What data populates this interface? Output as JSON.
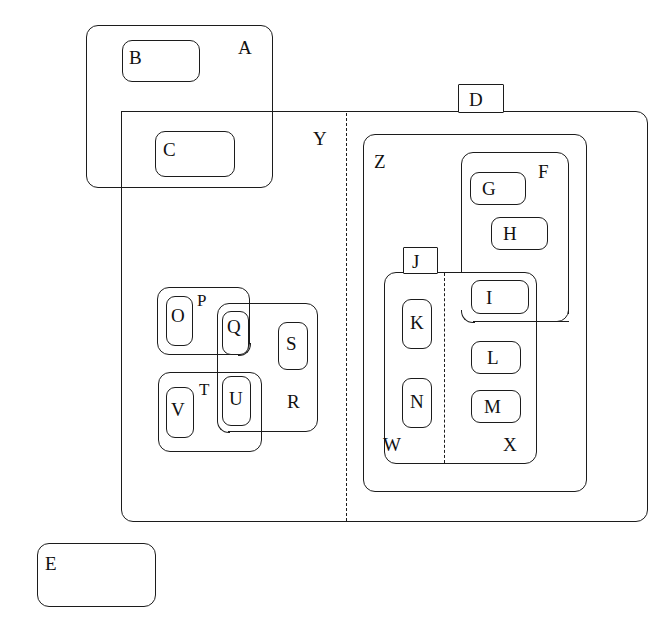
{
  "figure": {
    "type": "nested-region-diagram",
    "background": "#ffffff",
    "stroke_color": "#1c1c1c",
    "text_color": "#111111",
    "width": 665,
    "height": 644,
    "caption": ""
  },
  "regions": [
    {
      "id": "A",
      "label": "A",
      "shape": "rounded-rect",
      "x": 86,
      "y": 25,
      "w": 187,
      "h": 163,
      "label_x": 238,
      "label_y": 38,
      "style": "solid"
    },
    {
      "id": "B",
      "label": "B",
      "shape": "rounded-rect",
      "x": 122,
      "y": 40,
      "w": 78,
      "h": 42,
      "label_x": 129,
      "label_y": 48,
      "style": "solid"
    },
    {
      "id": "C",
      "label": "C",
      "shape": "rounded-rect",
      "x": 155,
      "y": 131,
      "w": 80,
      "h": 46,
      "label_x": 163,
      "label_y": 140,
      "style": "solid"
    },
    {
      "id": "Y",
      "label": "Y",
      "shape": "rounded-rect",
      "x": 121,
      "y": 111,
      "w": 527,
      "h": 411,
      "label_x": 313,
      "label_y": 129,
      "style": "solid"
    },
    {
      "id": "D",
      "label": "D",
      "shape": "tab-rect",
      "x": 458,
      "y": 84,
      "w": 46,
      "h": 28,
      "label_x": 469,
      "label_y": 90,
      "style": "solid"
    },
    {
      "id": "Z",
      "label": "Z",
      "shape": "rounded-rect",
      "x": 363,
      "y": 134,
      "w": 224,
      "h": 358,
      "label_x": 374,
      "label_y": 152,
      "style": "solid"
    },
    {
      "id": "F",
      "label": "F",
      "shape": "rounded-rect",
      "x": 461,
      "y": 152,
      "w": 108,
      "h": 170,
      "label_x": 538,
      "label_y": 162,
      "style": "solid"
    },
    {
      "id": "G",
      "label": "G",
      "shape": "rounded-rect",
      "x": 470,
      "y": 172,
      "w": 56,
      "h": 33,
      "label_x": 482,
      "label_y": 179,
      "style": "solid"
    },
    {
      "id": "H",
      "label": "H",
      "shape": "rounded-rect",
      "x": 491,
      "y": 217,
      "w": 57,
      "h": 33,
      "label_x": 503,
      "label_y": 224,
      "style": "solid"
    },
    {
      "id": "I",
      "label": "I",
      "shape": "rounded-rect",
      "x": 471,
      "y": 280,
      "w": 58,
      "h": 34,
      "label_x": 486,
      "label_y": 288,
      "style": "solid"
    },
    {
      "id": "J",
      "label": "J",
      "shape": "tab-rect",
      "x": 403,
      "y": 247,
      "w": 35,
      "h": 27,
      "label_x": 412,
      "label_y": 252,
      "style": "solid"
    },
    {
      "id": "JW",
      "label": "",
      "shape": "rounded-rect",
      "x": 384,
      "y": 272,
      "w": 153,
      "h": 192,
      "label_x": 0,
      "label_y": 0,
      "style": "solid"
    },
    {
      "id": "W",
      "label": "W",
      "shape": "label-only",
      "x": 0,
      "y": 0,
      "w": 0,
      "h": 0,
      "label_x": 383,
      "label_y": 435,
      "style": "none"
    },
    {
      "id": "X",
      "label": "X",
      "shape": "label-only",
      "x": 0,
      "y": 0,
      "w": 0,
      "h": 0,
      "label_x": 503,
      "label_y": 435,
      "style": "none"
    },
    {
      "id": "K",
      "label": "K",
      "shape": "rounded-rect",
      "x": 402,
      "y": 299,
      "w": 30,
      "h": 50,
      "label_x": 410,
      "label_y": 313,
      "style": "solid"
    },
    {
      "id": "N",
      "label": "N",
      "shape": "rounded-rect",
      "x": 402,
      "y": 378,
      "w": 30,
      "h": 50,
      "label_x": 410,
      "label_y": 392,
      "style": "solid"
    },
    {
      "id": "L",
      "label": "L",
      "shape": "rounded-rect",
      "x": 471,
      "y": 341,
      "w": 50,
      "h": 33,
      "label_x": 487,
      "label_y": 348,
      "style": "solid"
    },
    {
      "id": "M",
      "label": "M",
      "shape": "rounded-rect",
      "x": 471,
      "y": 390,
      "w": 50,
      "h": 33,
      "label_x": 484,
      "label_y": 397,
      "style": "solid"
    },
    {
      "id": "P",
      "label": "P",
      "shape": "rounded-rect",
      "x": 157,
      "y": 287,
      "w": 93,
      "h": 68,
      "label_x": 197,
      "label_y": 292,
      "style": "solid"
    },
    {
      "id": "O",
      "label": "O",
      "shape": "rounded-rect",
      "x": 166,
      "y": 296,
      "w": 27,
      "h": 50,
      "label_x": 172,
      "label_y": 306,
      "style": "solid"
    },
    {
      "id": "R",
      "label": "R",
      "shape": "rounded-rect",
      "x": 217,
      "y": 303,
      "w": 101,
      "h": 129,
      "label_x": 288,
      "label_y": 392,
      "style": "solid"
    },
    {
      "id": "Q",
      "label": "Q",
      "shape": "rounded-rect",
      "x": 222,
      "y": 311,
      "w": 27,
      "h": 44,
      "label_x": 228,
      "label_y": 317,
      "style": "solid"
    },
    {
      "id": "S",
      "label": "S",
      "shape": "rounded-rect",
      "x": 278,
      "y": 322,
      "w": 30,
      "h": 48,
      "label_x": 287,
      "label_y": 333,
      "style": "solid"
    },
    {
      "id": "T",
      "label": "T",
      "shape": "rounded-rect",
      "x": 158,
      "y": 372,
      "w": 104,
      "h": 80,
      "label_x": 199,
      "label_y": 381,
      "style": "solid"
    },
    {
      "id": "U",
      "label": "U",
      "shape": "rounded-rect",
      "x": 222,
      "y": 376,
      "w": 29,
      "h": 50,
      "label_x": 229,
      "label_y": 389,
      "style": "solid"
    },
    {
      "id": "V",
      "label": "V",
      "shape": "rounded-rect",
      "x": 166,
      "y": 387,
      "w": 28,
      "h": 51,
      "label_x": 172,
      "label_y": 400,
      "style": "solid"
    },
    {
      "id": "E",
      "label": "E",
      "shape": "rounded-rect",
      "x": 37,
      "y": 543,
      "w": 119,
      "h": 64,
      "label_x": 45,
      "label_y": 554,
      "style": "solid"
    }
  ],
  "dividers": [
    {
      "id": "y-split",
      "orientation": "vertical",
      "x": 346,
      "y1": 113,
      "y2": 521,
      "style": "dashed"
    },
    {
      "id": "wx-split",
      "orientation": "vertical",
      "x": 444,
      "y1": 273,
      "y2": 463,
      "style": "dashed"
    }
  ],
  "labels": {
    "A": "A",
    "B": "B",
    "C": "C",
    "D": "D",
    "E": "E",
    "F": "F",
    "G": "G",
    "H": "H",
    "I": "I",
    "J": "J",
    "K": "K",
    "L": "L",
    "M": "M",
    "N": "N",
    "O": "O",
    "P": "P",
    "Q": "Q",
    "R": "R",
    "S": "S",
    "T": "T",
    "U": "U",
    "V": "V",
    "W": "W",
    "X": "X",
    "Y": "Y",
    "Z": "Z"
  }
}
